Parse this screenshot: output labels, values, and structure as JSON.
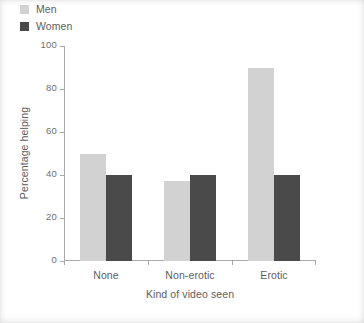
{
  "chart_data": {
    "type": "bar",
    "title": "",
    "subtitle": "",
    "xlabel": "Kind of video seen",
    "ylabel": "Percentage helping",
    "categories": [
      "None",
      "Non-erotic",
      "Erotic"
    ],
    "series": [
      {
        "name": "Men",
        "values": [
          50,
          37,
          90
        ],
        "color": "#d2d2d2"
      },
      {
        "name": "Women",
        "values": [
          40,
          40,
          40
        ],
        "color": "#4a4a4a"
      }
    ],
    "ylim": [
      0,
      100
    ],
    "yticks": [
      0,
      20,
      40,
      60,
      80,
      100
    ],
    "ytick_labels": [
      "0",
      "20",
      "40",
      "60",
      "80",
      "100"
    ],
    "grid": false,
    "legend_position": "upper left",
    "axis_color": "#a8a8a8",
    "text_color": "#5d5d5d",
    "background": "#ffffff"
  },
  "legend": {
    "items": [
      {
        "label": "Men",
        "swatch": "#d2d2d2"
      },
      {
        "label": "Women",
        "swatch": "#4a4a4a"
      }
    ]
  }
}
